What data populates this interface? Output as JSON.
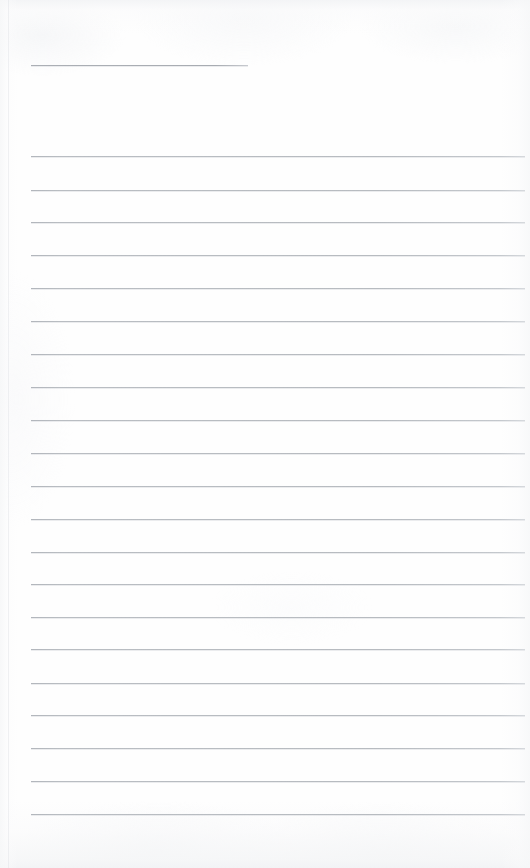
{
  "document": {
    "type": "scanned-lined-paper",
    "title": "Blank ruled notebook page",
    "caption": "",
    "page_width": 530,
    "page_height": 868,
    "background_color": "#fefefe",
    "rule_color": "#b9bdc2",
    "rule_color_dark": "#a9adb3",
    "has_handwriting": false,
    "has_text_content": false,
    "visible_text": ""
  },
  "ruling": {
    "left_margin_x": 31,
    "right_edge_x": 525,
    "line_spacing": 32.7,
    "line_thickness": 1,
    "total_lines": 22,
    "first_line_is_short": true,
    "first_line_end_x": 248,
    "lines": [
      {
        "index": 0,
        "y": 65,
        "x1": 31,
        "x2": 248,
        "short": true
      },
      {
        "index": 1,
        "y": 156,
        "x1": 31,
        "x2": 525,
        "short": false
      },
      {
        "index": 2,
        "y": 190,
        "x1": 31,
        "x2": 525,
        "short": false
      },
      {
        "index": 3,
        "y": 222,
        "x1": 31,
        "x2": 525,
        "short": false
      },
      {
        "index": 4,
        "y": 255,
        "x1": 31,
        "x2": 525,
        "short": false
      },
      {
        "index": 5,
        "y": 288,
        "x1": 31,
        "x2": 525,
        "short": false
      },
      {
        "index": 6,
        "y": 321,
        "x1": 31,
        "x2": 525,
        "short": false
      },
      {
        "index": 7,
        "y": 354,
        "x1": 31,
        "x2": 525,
        "short": false
      },
      {
        "index": 8,
        "y": 387,
        "x1": 31,
        "x2": 525,
        "short": false
      },
      {
        "index": 9,
        "y": 420,
        "x1": 31,
        "x2": 525,
        "short": false
      },
      {
        "index": 10,
        "y": 453,
        "x1": 31,
        "x2": 525,
        "short": false
      },
      {
        "index": 11,
        "y": 486,
        "x1": 31,
        "x2": 525,
        "short": false
      },
      {
        "index": 12,
        "y": 519,
        "x1": 31,
        "x2": 525,
        "short": false
      },
      {
        "index": 13,
        "y": 552,
        "x1": 31,
        "x2": 525,
        "short": false
      },
      {
        "index": 14,
        "y": 584,
        "x1": 31,
        "x2": 525,
        "short": false
      },
      {
        "index": 15,
        "y": 617,
        "x1": 31,
        "x2": 525,
        "short": false
      },
      {
        "index": 16,
        "y": 649,
        "x1": 31,
        "x2": 525,
        "short": false
      },
      {
        "index": 17,
        "y": 683,
        "x1": 31,
        "x2": 525,
        "short": false
      },
      {
        "index": 18,
        "y": 715,
        "x1": 31,
        "x2": 525,
        "short": false
      },
      {
        "index": 19,
        "y": 748,
        "x1": 31,
        "x2": 525,
        "short": false
      },
      {
        "index": 20,
        "y": 781,
        "x1": 31,
        "x2": 525,
        "short": false
      },
      {
        "index": 21,
        "y": 814,
        "x1": 31,
        "x2": 525,
        "short": false
      }
    ]
  },
  "edges": {
    "left_seam_x": 8,
    "top_shadow_height": 22,
    "bottom_shadow_height": 38
  }
}
